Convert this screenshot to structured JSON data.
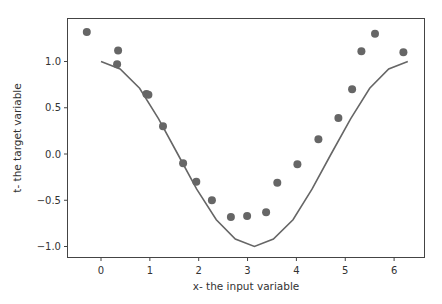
{
  "chart_data": {
    "type": "scatter",
    "title": "",
    "xlabel": "x- the input variable",
    "ylabel": "t- the target variable",
    "xlim": [
      -0.7,
      6.6
    ],
    "ylim": [
      -1.1,
      1.45
    ],
    "xticks": [
      0,
      1,
      2,
      3,
      4,
      5,
      6
    ],
    "xtick_labels": [
      "0",
      "1",
      "2",
      "3",
      "4",
      "5",
      "6"
    ],
    "yticks": [
      1.0,
      0.5,
      0.0,
      -0.5,
      -1.0
    ],
    "ytick_labels": [
      "1.0",
      "0.5",
      "0.0",
      "−0.5",
      "−1.0"
    ],
    "grid": false,
    "legend": null,
    "series": [
      {
        "name": "observations",
        "kind": "scatter",
        "color": "#666666",
        "x": [
          -0.29,
          0.35,
          0.33,
          0.93,
          0.97,
          1.27,
          1.68,
          1.95,
          2.27,
          2.66,
          2.99,
          3.38,
          3.61,
          4.02,
          4.45,
          4.86,
          5.14,
          5.33,
          5.61,
          6.19
        ],
        "y": [
          1.32,
          1.12,
          0.97,
          0.65,
          0.64,
          0.3,
          -0.1,
          -0.3,
          -0.5,
          -0.68,
          -0.67,
          -0.63,
          -0.31,
          -0.11,
          0.16,
          0.39,
          0.7,
          1.11,
          1.3,
          1.1
        ]
      },
      {
        "name": "cos(x)",
        "kind": "line",
        "color": "#666666",
        "x": [
          0.0,
          0.39,
          0.79,
          1.18,
          1.57,
          1.96,
          2.36,
          2.75,
          3.14,
          3.53,
          3.93,
          4.32,
          4.71,
          5.11,
          5.5,
          5.89,
          6.28
        ],
        "y": [
          1.0,
          0.92,
          0.71,
          0.38,
          0.0,
          -0.38,
          -0.71,
          -0.92,
          -1.0,
          -0.92,
          -0.71,
          -0.38,
          0.0,
          0.38,
          0.71,
          0.92,
          1.0
        ]
      }
    ]
  }
}
